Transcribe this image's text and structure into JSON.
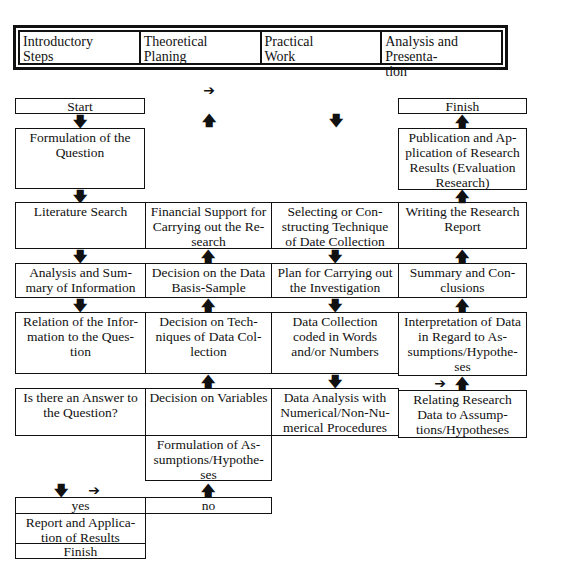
{
  "header": {
    "phases": [
      {
        "label": "Introductory\nSteps"
      },
      {
        "label": "Theoretical\nPlaning"
      },
      {
        "label": "Practical\nWork"
      },
      {
        "label": "Analysis and Presenta-\ntion"
      }
    ]
  },
  "boxes": {
    "start": "Start",
    "formulation_question": "Formulation of the\nQuestion",
    "literature_search": "Literature Search",
    "financial_support": "Financial Support for\nCarrying out the Re-\nsearch",
    "selecting_technique": "Selecting or Con-\nstructing Technique\nof Date Collection",
    "writing_report": "Writing the Research\nReport",
    "analysis_summary": "Analysis and Sum-\nmary of Information",
    "decision_sample": "Decision on the Data\nBasis-Sample",
    "plan_investigation": "Plan for Carrying out\nthe Investigation",
    "summary_conclusions": "Summary and Con-\nclusions",
    "relation_information": "Relation of the Infor-\nmation to the Ques-\ntion",
    "decision_techniques": "Decision on Tech-\nniques of Data Col-\nlection",
    "data_collection": "Data Collection\ncoded in Words\nand/or Numbers",
    "interpretation_data": "Interpretation of Data\nin Regard to As-\nsumptions/Hypothe-\nses",
    "answer_question": "Is there an Answer to\nthe Question?",
    "decision_variables": "Decision on Variables",
    "data_analysis": "Data Analysis with\nNumerical/Non-Nu-\nmerical Procedures",
    "relating_data": "Relating Research\nData to Assump-\ntions/Hypotheses",
    "formulation_assumptions": "Formulation of As-\nsumptions/Hypothe-\nses",
    "yes": "yes",
    "no": "no",
    "report_application": "Report and Applica-\ntion of Results",
    "finish_left": "Finish",
    "finish_right": "Finish",
    "publication": "Publication and Ap-\nplication of Research\nResults (Evaluation\nResearch)"
  },
  "arrows": {
    "right": "➔",
    "up": "🡅",
    "down": "🡇"
  }
}
